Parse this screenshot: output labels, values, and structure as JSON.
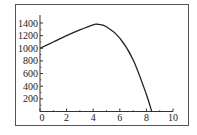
{
  "chart_data": {
    "type": "line",
    "title": "",
    "xlabel": "",
    "ylabel": "",
    "xlim": [
      0,
      10
    ],
    "ylim": [
      0,
      1500
    ],
    "x_ticks": [
      "0",
      "2",
      "4",
      "6",
      "8",
      "10"
    ],
    "y_ticks": [
      "200",
      "400",
      "600",
      "800",
      "1000",
      "1200",
      "1400"
    ],
    "grid": false,
    "legend": null,
    "series": [
      {
        "name": "curve",
        "color": "#222222",
        "x": [
          0,
          1,
          2,
          3,
          4,
          4.3,
          5,
          6,
          7,
          8,
          8.4
        ],
        "y": [
          1000,
          1100,
          1200,
          1290,
          1370,
          1380,
          1340,
          1160,
          820,
          270,
          0
        ]
      }
    ]
  },
  "colors": {
    "axis": "#333333",
    "frame": "#555555",
    "line": "#222222",
    "background": "#ffffff"
  }
}
